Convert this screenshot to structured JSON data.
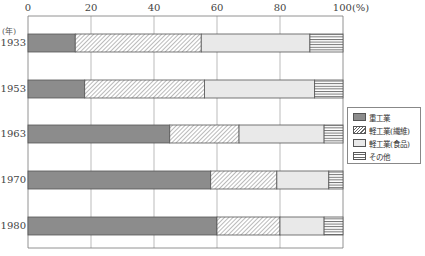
{
  "chart_data": {
    "type": "bar",
    "orientation": "horizontal",
    "stacked": true,
    "title": "",
    "xlabel": "",
    "ylabel": "(年)",
    "x_unit": "(%)",
    "xlim": [
      0,
      100
    ],
    "x_ticks": [
      "0",
      "20",
      "40",
      "60",
      "80",
      "100"
    ],
    "categories": [
      "1933",
      "1953",
      "1963",
      "1970",
      "1980"
    ],
    "series": [
      {
        "name": "重工業",
        "pattern": "solid-dark-gray",
        "values": [
          15,
          18,
          45,
          58,
          60
        ]
      },
      {
        "name": "軽工業(繊維)",
        "pattern": "diagonal-hatch",
        "values": [
          40,
          38,
          22,
          21,
          20
        ]
      },
      {
        "name": "軽工業(食品)",
        "pattern": "light-gray",
        "values": [
          34.5,
          35,
          27,
          16.5,
          14
        ]
      },
      {
        "name": "その他",
        "pattern": "horizontal-lines",
        "values": [
          10.5,
          9,
          6,
          4.5,
          6
        ]
      }
    ],
    "grid": {
      "vertical": true,
      "horizontal": false
    },
    "legend_position": "right"
  },
  "axis": {
    "unit_label": "(年)",
    "percent_label": "(%)"
  },
  "colors": {
    "heavy": "#8c8c8c",
    "food": "#e9e9e9",
    "line": "#666666",
    "grid": "#999999"
  }
}
